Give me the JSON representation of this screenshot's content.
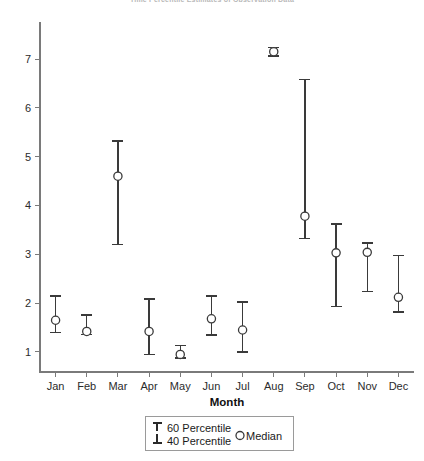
{
  "chart_data": {
    "type": "scatter",
    "title": "Time Percentile Estimates of Observation Data",
    "xlabel": "Month",
    "ylabel": "",
    "categories": [
      "Jan",
      "Feb",
      "Mar",
      "Apr",
      "May",
      "Jun",
      "Jul",
      "Aug",
      "Sep",
      "Oct",
      "Nov",
      "Dec"
    ],
    "ylim": [
      0.55,
      7.45
    ],
    "yticks": [
      1,
      2,
      3,
      4,
      5,
      6,
      7
    ],
    "ytick_labels": [
      "1",
      "2",
      "3",
      "4",
      "5",
      "6",
      "7"
    ],
    "grid": false,
    "legend_position": "below-axis-center",
    "series": [
      {
        "name": "Median",
        "values": [
          1.65,
          1.42,
          4.6,
          1.42,
          0.95,
          1.68,
          1.45,
          7.15,
          3.78,
          3.03,
          3.04,
          2.12
        ]
      },
      {
        "name": "60 Percentile",
        "values": [
          2.15,
          1.76,
          5.32,
          2.08,
          1.13,
          2.15,
          2.02,
          7.24,
          6.58,
          3.62,
          3.23,
          2.98
        ]
      },
      {
        "name": "40 Percentile",
        "values": [
          1.4,
          1.36,
          3.2,
          0.95,
          0.88,
          1.35,
          1.0,
          7.06,
          3.32,
          1.93,
          2.24,
          1.82
        ]
      }
    ],
    "points": [
      {
        "category": "Jan",
        "median": 1.65,
        "p60": 2.15,
        "p40": 1.4
      },
      {
        "category": "Feb",
        "median": 1.42,
        "p60": 1.76,
        "p40": 1.36
      },
      {
        "category": "Mar",
        "median": 4.6,
        "p60": 5.32,
        "p40": 3.2
      },
      {
        "category": "Apr",
        "median": 1.42,
        "p60": 2.08,
        "p40": 0.95
      },
      {
        "category": "May",
        "median": 0.95,
        "p60": 1.13,
        "p40": 0.88
      },
      {
        "category": "Jun",
        "median": 1.68,
        "p60": 2.15,
        "p40": 1.35
      },
      {
        "category": "Jul",
        "median": 1.45,
        "p60": 2.02,
        "p40": 1.0
      },
      {
        "category": "Aug",
        "median": 7.15,
        "p60": 7.24,
        "p40": 7.06
      },
      {
        "category": "Sep",
        "median": 3.78,
        "p60": 6.58,
        "p40": 3.32
      },
      {
        "category": "Oct",
        "median": 3.03,
        "p60": 3.62,
        "p40": 1.93
      },
      {
        "category": "Nov",
        "median": 3.04,
        "p60": 3.23,
        "p40": 2.24
      },
      {
        "category": "Dec",
        "median": 2.12,
        "p60": 2.98,
        "p40": 1.82
      }
    ],
    "legend": [
      {
        "label": "60 Percentile",
        "marker": "upper-cap"
      },
      {
        "label": "40 Percentile",
        "marker": "lower-cap"
      },
      {
        "label": "Median",
        "marker": "open-circle"
      }
    ],
    "colors": {
      "marker": "#3a3a3a",
      "axis": "#7a7a7a",
      "text": "#1a1a1a",
      "background": "#ffffff"
    }
  }
}
